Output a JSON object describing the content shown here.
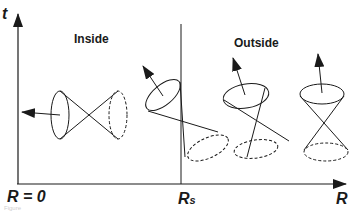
{
  "diagram": {
    "type": "light-cone tilting diagram",
    "axes": {
      "vertical_label": "t",
      "horizontal_label": "R",
      "origin_label": "R = 0",
      "boundary_label": "R",
      "boundary_subscript": "s"
    },
    "regions": {
      "inside_label": "Inside",
      "outside_label": "Outside"
    },
    "cones": [
      {
        "region": "inside",
        "position": "left",
        "orientation": "tilted ~90° left (horizontal)",
        "arrow_direction": "left"
      },
      {
        "region": "inside",
        "position": "at boundary",
        "orientation": "tilted ~45° up-left",
        "arrow_direction": "up-left"
      },
      {
        "region": "outside",
        "position": "middle",
        "orientation": "slightly tilted left",
        "arrow_direction": "up, slightly left"
      },
      {
        "region": "outside",
        "position": "right",
        "orientation": "upright",
        "arrow_direction": "up"
      }
    ],
    "colors": {
      "ink": "#1a1a1a",
      "background": "#ffffff"
    },
    "caption": "Figure"
  }
}
